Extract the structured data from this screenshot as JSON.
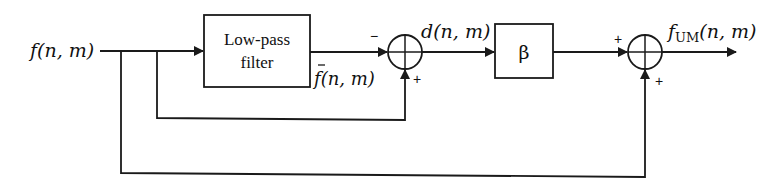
{
  "diagram": {
    "input_label": "f(n, m)",
    "input_func": "f",
    "input_args": "(n, m)",
    "lowpass_box": {
      "line1": "Low-pass",
      "line2": "filter"
    },
    "lowpass_output_label": {
      "func": "f",
      "args": "(n, m)",
      "overbar": true
    },
    "sum1": {
      "top_sign": "−",
      "bottom_sign": "+"
    },
    "difference_label": {
      "func": "d",
      "args": "(n, m)"
    },
    "gain_box": {
      "label": "β"
    },
    "sum2": {
      "left_sign": "+",
      "bottom_sign": "+"
    },
    "output_label": {
      "func": "f",
      "subscript": "UM",
      "args": "(n, m)"
    },
    "colors": {
      "stroke": "#1a1a1a",
      "background": "#ffffff"
    }
  }
}
